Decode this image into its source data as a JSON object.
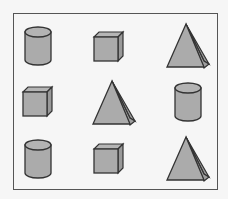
{
  "colors": {
    "background": "#f6f6f6",
    "fill": "#ababab",
    "fill_dark": "#999999",
    "stroke": "#333333",
    "frame": "#555555"
  },
  "grid": [
    [
      "cylinder",
      "cube",
      "pyramid"
    ],
    [
      "cube",
      "pyramid",
      "cylinder"
    ],
    [
      "cylinder",
      "cube",
      "pyramid"
    ]
  ]
}
